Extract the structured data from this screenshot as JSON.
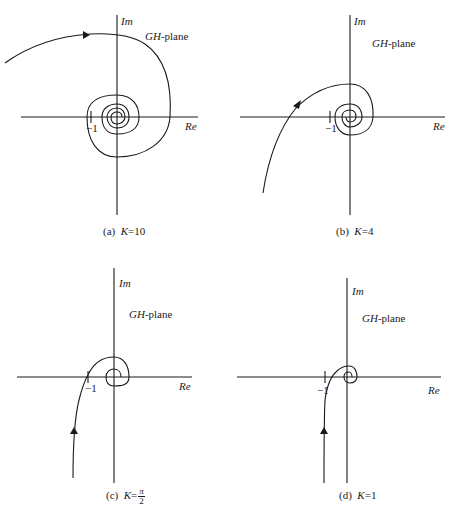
{
  "figure": {
    "panels": [
      {
        "id": "a",
        "plane_label": "GH-plane",
        "plane_label_italic": "GH",
        "plane_label_rest": "-plane",
        "im_label": "Im",
        "re_label": "Re",
        "tick_label": "−1",
        "caption_prefix": "(a)",
        "caption_k": "K",
        "caption_value": "=10"
      },
      {
        "id": "b",
        "plane_label": "GH-plane",
        "plane_label_italic": "GH",
        "plane_label_rest": "-plane",
        "im_label": "Im",
        "re_label": "Re",
        "tick_label": "−1",
        "caption_prefix": "(b)",
        "caption_k": "K",
        "caption_value": "=4"
      },
      {
        "id": "c",
        "plane_label": "GH-plane",
        "plane_label_italic": "GH",
        "plane_label_rest": "-plane",
        "im_label": "Im",
        "re_label": "Re",
        "tick_label": "−1",
        "caption_prefix": "(c)",
        "caption_k": "K",
        "caption_eq": "=",
        "caption_num": "π",
        "caption_den": "2"
      },
      {
        "id": "d",
        "plane_label": "GH-plane",
        "plane_label_italic": "GH",
        "plane_label_rest": "-plane",
        "im_label": "Im",
        "re_label": "Re",
        "tick_label": "−1",
        "caption_prefix": "(d)",
        "caption_k": "K",
        "caption_value": "=1"
      }
    ],
    "stroke_color": "#1a1a1a",
    "background": "#ffffff"
  }
}
